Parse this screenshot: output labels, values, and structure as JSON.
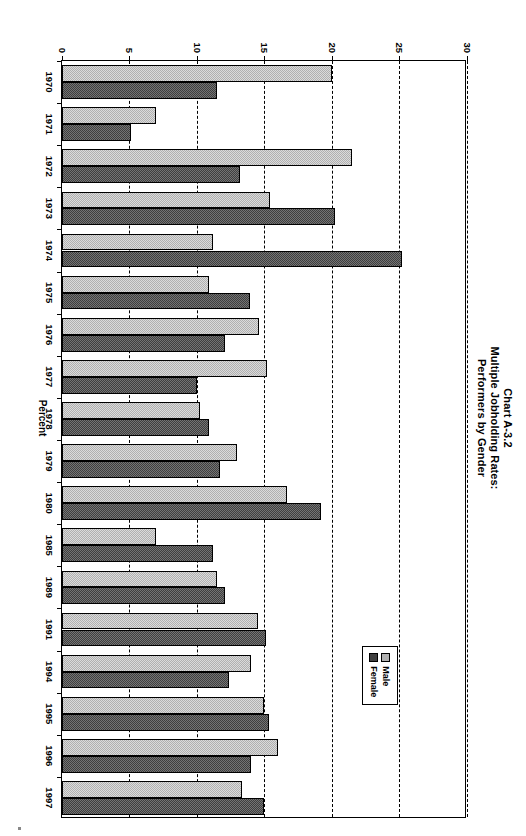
{
  "title": {
    "line1": "Chart A-3.2",
    "line2": "Multiple Jobholding Rates:",
    "line3": "Performers by Gender"
  },
  "legend": {
    "male_label": "Male",
    "female_label": "Female"
  },
  "chart_data": {
    "type": "bar",
    "orientation": "horizontal",
    "title": "Chart A-3.2 Multiple Jobholding Rates: Performers by Gender",
    "xlabel": "Percent",
    "ylabel": "",
    "axis_title": "Percent",
    "ylim": [
      0,
      30
    ],
    "tick_values": [
      0,
      5,
      10,
      15,
      20,
      25,
      30
    ],
    "tick_labels": [
      "0",
      "5",
      "10",
      "15",
      "20",
      "25",
      "30"
    ],
    "grid": true,
    "legend_position": "inside-lower-right",
    "categories": [
      "1970",
      "1971",
      "1972",
      "1973",
      "1974",
      "1975",
      "1976",
      "1977",
      "1978",
      "1979",
      "1980",
      "1985",
      "1989",
      "1991",
      "1994",
      "1995",
      "1996",
      "1997"
    ],
    "series": [
      {
        "name": "Male",
        "color": "#b0b0b0",
        "values": [
          20.0,
          7.0,
          21.5,
          15.4,
          11.2,
          10.9,
          14.6,
          15.2,
          10.2,
          13.0,
          16.7,
          7.0,
          11.5,
          14.5,
          14.0,
          15.0,
          16.0,
          13.3
        ]
      },
      {
        "name": "Female",
        "color": "#3f3f3f",
        "values": [
          11.5,
          5.1,
          13.2,
          20.2,
          25.2,
          13.9,
          12.1,
          10.0,
          10.9,
          11.7,
          19.2,
          11.2,
          12.1,
          15.1,
          12.4,
          15.3,
          14.0,
          15.0
        ]
      }
    ]
  }
}
